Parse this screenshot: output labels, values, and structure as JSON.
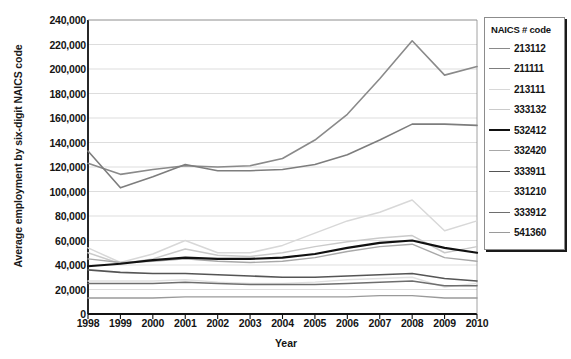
{
  "chart_data": {
    "type": "line",
    "title": "",
    "xlabel": "Year",
    "ylabel": "Average employment by six-digit NAICS code",
    "x": [
      1998,
      1999,
      2000,
      2001,
      2002,
      2003,
      2004,
      2005,
      2006,
      2007,
      2008,
      2009,
      2010
    ],
    "xtick_labels": [
      "1998",
      "1999",
      "2000",
      "2001",
      "2002",
      "2003",
      "2004",
      "2005",
      "2006",
      "2007",
      "2008",
      "2009",
      "2010"
    ],
    "ytick_labels": [
      "0",
      "20,000",
      "40,000",
      "60,000",
      "80,000",
      "100,000",
      "120,000",
      "140,000",
      "160,000",
      "180,000",
      "200,000",
      "220,000",
      "240,000"
    ],
    "ytick_values": [
      0,
      20000,
      40000,
      60000,
      80000,
      100000,
      120000,
      140000,
      160000,
      180000,
      200000,
      220000,
      240000
    ],
    "ylim": [
      0,
      240000
    ],
    "xlim": [
      1998,
      2010
    ],
    "grid": true,
    "grid_axis": "y",
    "legend_position": "right",
    "legend_title": "NAICS # code",
    "series": [
      {
        "name": "213112",
        "color": "#8a8a8a",
        "width": 1.6,
        "values": [
          123000,
          114000,
          118000,
          121000,
          120000,
          121000,
          127000,
          142000,
          163000,
          192000,
          223000,
          195000,
          202000
        ]
      },
      {
        "name": "211111",
        "color": "#7d7d7d",
        "width": 1.6,
        "values": [
          133000,
          103000,
          112000,
          122000,
          117000,
          117000,
          118000,
          122000,
          130000,
          142000,
          155000,
          155000,
          154000
        ]
      },
      {
        "name": "213111",
        "color": "#d8d8d8",
        "width": 1.5,
        "values": [
          54000,
          42000,
          49000,
          60000,
          50000,
          50000,
          56000,
          66000,
          76000,
          83000,
          93000,
          68000,
          76000
        ]
      },
      {
        "name": "333132",
        "color": "#cacaca",
        "width": 1.5,
        "values": [
          50000,
          41000,
          45000,
          53000,
          48000,
          47000,
          50000,
          55000,
          59000,
          62000,
          64000,
          50000,
          55000
        ]
      },
      {
        "name": "532412",
        "color": "#111111",
        "width": 2.2,
        "values": [
          39000,
          41000,
          44000,
          46000,
          45000,
          45000,
          46000,
          49000,
          54000,
          58000,
          60000,
          54000,
          50000
        ]
      },
      {
        "name": "332420",
        "color": "#a8a8a8",
        "width": 1.4,
        "values": [
          45000,
          42000,
          43000,
          45000,
          43000,
          42000,
          43000,
          46000,
          51000,
          55000,
          57000,
          46000,
          43000
        ]
      },
      {
        "name": "333911",
        "color": "#555555",
        "width": 1.6,
        "values": [
          36000,
          34000,
          33000,
          33000,
          32000,
          31000,
          30000,
          30000,
          31000,
          32000,
          33000,
          29000,
          27000
        ]
      },
      {
        "name": "331210",
        "color": "#e0e0e0",
        "width": 1.4,
        "values": [
          27000,
          27000,
          27000,
          28000,
          26000,
          25000,
          25000,
          26000,
          28000,
          29000,
          30000,
          22000,
          25000
        ]
      },
      {
        "name": "333912",
        "color": "#6e6e6e",
        "width": 1.5,
        "values": [
          25000,
          25000,
          25000,
          26000,
          25000,
          24000,
          24000,
          24000,
          25000,
          26000,
          27000,
          23000,
          23000
        ]
      },
      {
        "name": "541360",
        "color": "#9a9a9a",
        "width": 1.4,
        "values": [
          13000,
          13000,
          13000,
          14000,
          14000,
          14000,
          14000,
          14000,
          14000,
          15000,
          15000,
          13000,
          13000
        ]
      }
    ]
  }
}
